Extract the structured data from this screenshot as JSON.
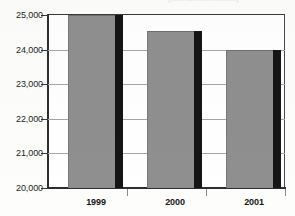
{
  "caption": {
    "clipped_text": "(........................)"
  },
  "chart_data": {
    "type": "bar",
    "title": "",
    "subtitle": "",
    "xlabel": "",
    "ylabel": "",
    "categories": [
      "1999",
      "2000",
      "2001"
    ],
    "values": [
      25000,
      24550,
      24000
    ],
    "ylim": [
      20000,
      25000
    ],
    "ytick_values": [
      20000,
      21000,
      22000,
      23000,
      24000,
      25000
    ],
    "ytick_labels": [
      "20,000",
      "21,000",
      "22,000",
      "23,000",
      "24,000",
      "25,000"
    ],
    "grid": true,
    "legend": false,
    "legend_position": "none",
    "series": [
      {
        "name": "",
        "values": [
          25000,
          24550,
          24000
        ]
      }
    ],
    "bar_color": "#8f8f8f",
    "bar_shadow_color": "#151515",
    "gridline_color": "#a6a6a6",
    "axis_color": "#2e2e2e",
    "background_color": "#ffffff"
  }
}
